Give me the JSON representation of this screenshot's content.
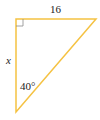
{
  "diagram": {
    "type": "right-triangle",
    "stroke_color": "#f5c242",
    "labels": {
      "top_side": "16",
      "left_side": "x",
      "bottom_angle": "40°"
    },
    "right_angle_marker": "top-left"
  }
}
